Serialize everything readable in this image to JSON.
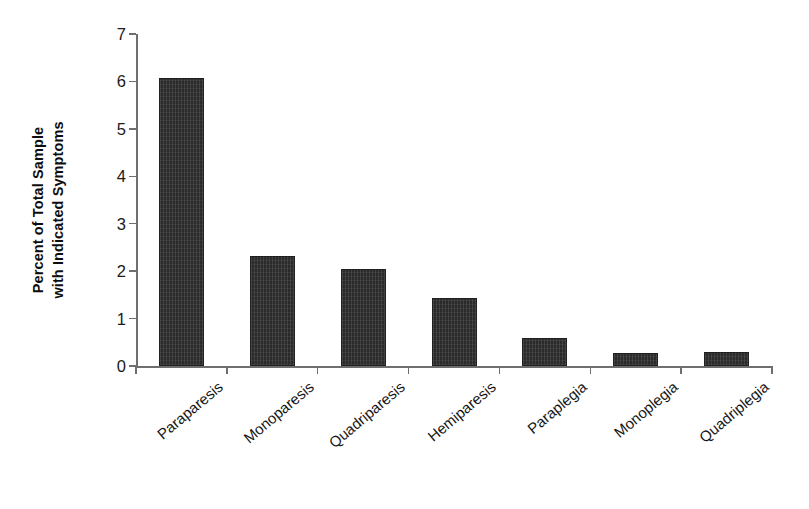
{
  "chart_data": {
    "type": "bar",
    "title": "",
    "subtitle": "",
    "xlabel": "",
    "ylabel": "Percent of Total Sample with Indicated Symptoms",
    "ylabel_lines": [
      "Percent of Total Sample",
      "with Indicated Symptoms"
    ],
    "categories": [
      "Paraparesis",
      "Monoparesis",
      "Quadriparesis",
      "Hemiparesis",
      "Paraplegia",
      "Monoplegia",
      "Quadriplegia"
    ],
    "values": [
      6.08,
      2.32,
      2.04,
      1.43,
      0.6,
      0.28,
      0.29
    ],
    "ylim": [
      0,
      7
    ],
    "yticks": [
      0,
      1,
      2,
      3,
      4,
      5,
      6,
      7
    ],
    "ytick_labels": [
      "0",
      "1",
      "2",
      "3",
      "4",
      "5",
      "6",
      "7"
    ],
    "grid": false,
    "legend": null,
    "legend_position": "none",
    "bar_color": "#2b2b2b",
    "axis_color": "#6f6f6f",
    "background": "#ffffff",
    "xtick_label_rotation": -40
  }
}
